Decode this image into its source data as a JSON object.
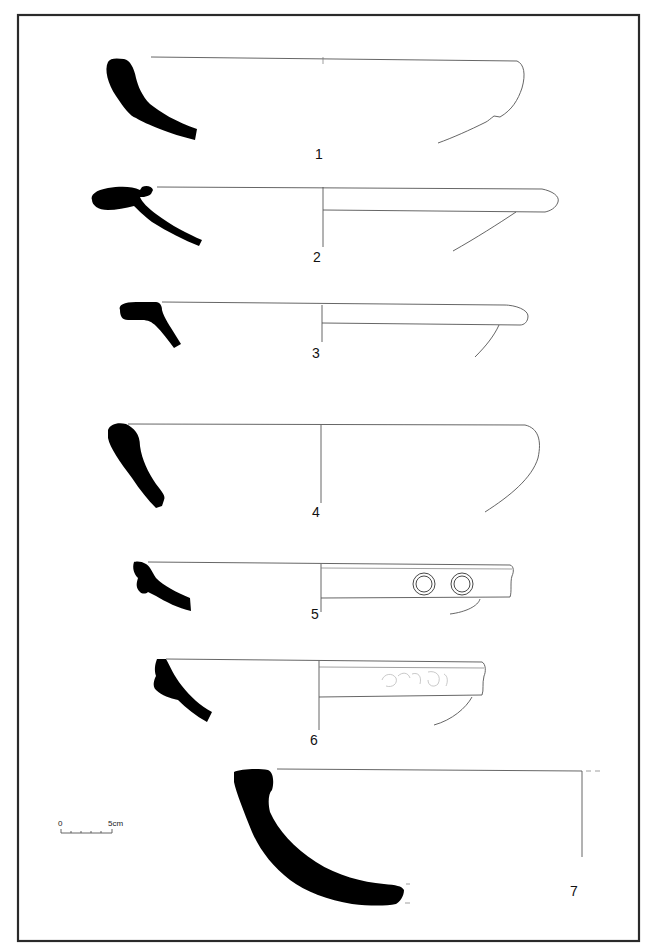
{
  "plate": {
    "type": "pottery profile drawing plate",
    "frame": {
      "x": 18,
      "y": 14,
      "width": 622,
      "height": 928
    }
  },
  "figures": [
    {
      "id": "1",
      "label": "1",
      "description": "bowl profile, incurved rim, carination"
    },
    {
      "id": "2",
      "label": "2",
      "description": "bowl/dish with flanged hooked rim"
    },
    {
      "id": "3",
      "label": "3",
      "description": "dish with thickened rounded rim"
    },
    {
      "id": "4",
      "label": "4",
      "description": "hemispherical bowl, thickened rim"
    },
    {
      "id": "5",
      "label": "5",
      "description": "bowl with stamped ring decoration on rim band",
      "stamps": 2
    },
    {
      "id": "6",
      "label": "6",
      "description": "bowl with rim band, faint stamped/rouletted motif"
    },
    {
      "id": "7",
      "label": "7",
      "description": "large deep bowl, thick wall"
    }
  ],
  "scale_bar": {
    "start_label": "0",
    "end_label": "5cm",
    "ticks": 6
  },
  "colors": {
    "ink": "#000000",
    "line": "#555555",
    "frame": "#2a2a2a",
    "paper": "#ffffff"
  }
}
